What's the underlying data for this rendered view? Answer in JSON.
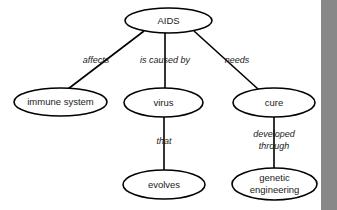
{
  "diagram": {
    "type": "concept-map",
    "background_color": "#ffffff",
    "stroke_color": "#000000",
    "text_color": "#1a1a1a",
    "nodes": [
      {
        "id": "aids",
        "label": "AIDS",
        "lines": [
          "AIDS"
        ],
        "cx": 168.5,
        "cy": 20.5,
        "rx": 43.5,
        "ry": 12.5
      },
      {
        "id": "immune_system",
        "label": "immune system",
        "lines": [
          "immune system"
        ],
        "cx": 60.5,
        "cy": 102.0,
        "rx": 46.5,
        "ry": 14.0
      },
      {
        "id": "virus",
        "label": "virus",
        "lines": [
          "virus"
        ],
        "cx": 163.5,
        "cy": 102.5,
        "rx": 39.5,
        "ry": 14.5
      },
      {
        "id": "cure",
        "label": "cure",
        "lines": [
          "cure"
        ],
        "cx": 274.0,
        "cy": 102.5,
        "rx": 41.0,
        "ry": 14.5
      },
      {
        "id": "evolves",
        "label": "evolves",
        "lines": [
          "evolves"
        ],
        "cx": 164.0,
        "cy": 184.5,
        "rx": 41.0,
        "ry": 14.5
      },
      {
        "id": "genetic_engineering",
        "label": "genetic engineering",
        "lines": [
          "genetic",
          "engineering"
        ],
        "cx": 274.5,
        "cy": 184.0,
        "rx": 42.5,
        "ry": 16.0
      }
    ],
    "edges": [
      {
        "id": "aids_affects_immune",
        "from": "aids",
        "to": "immune_system",
        "label": "affects",
        "label_lines": [
          "affects"
        ],
        "label_x": 96,
        "label_y": 61,
        "x1": 144,
        "y1": 31,
        "x2": 68,
        "y2": 89
      },
      {
        "id": "aids_caused_by_virus",
        "from": "aids",
        "to": "virus",
        "label": "is caused by",
        "label_lines": [
          "is caused by"
        ],
        "label_x": 165,
        "label_y": 61,
        "x1": 165,
        "y1": 33,
        "x2": 165,
        "y2": 88
      },
      {
        "id": "aids_needs_cure",
        "from": "aids",
        "to": "cure",
        "label": "needs",
        "label_lines": [
          "needs"
        ],
        "label_x": 237,
        "label_y": 61,
        "x1": 194,
        "y1": 31,
        "x2": 258,
        "y2": 89
      },
      {
        "id": "virus_that_evolves",
        "from": "virus",
        "to": "evolves",
        "label": "that",
        "label_lines": [
          "that"
        ],
        "label_x": 164,
        "label_y": 142,
        "x1": 164,
        "y1": 117,
        "x2": 164,
        "y2": 170
      },
      {
        "id": "cure_developed_through_ge",
        "from": "cure",
        "to": "genetic_engineering",
        "label": "developed through",
        "label_lines": [
          "developed",
          "through"
        ],
        "label_x": 274,
        "label_y": 141,
        "x1": 274,
        "y1": 117,
        "x2": 274,
        "y2": 168
      }
    ]
  },
  "right_bar": {
    "name": "scrollbar-gutter",
    "color": "#888888",
    "x": 321,
    "width": 16
  }
}
